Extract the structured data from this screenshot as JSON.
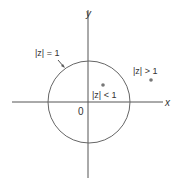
{
  "diagram": {
    "type": "complex-plane-unit-circle",
    "axes": {
      "x_label": "x",
      "y_label": "y",
      "origin_label": "0"
    },
    "circle": {
      "label": "|z| = 1"
    },
    "regions": [
      {
        "label": "|z| < 1",
        "description": "inside unit circle"
      },
      {
        "label": "|z| > 1",
        "description": "outside unit circle"
      }
    ],
    "colors": {
      "line": "#555555",
      "point": "#777777",
      "text": "#333333"
    }
  }
}
